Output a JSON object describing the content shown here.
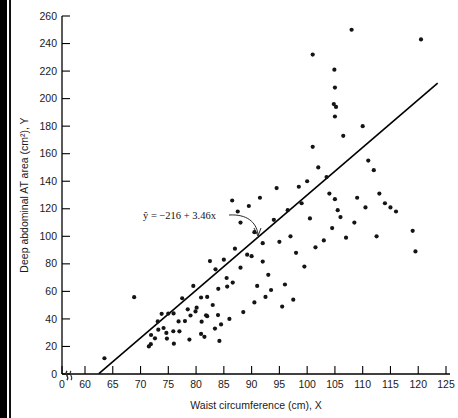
{
  "figure": {
    "background": "#ffffff",
    "point_color": "#141414",
    "line_color": "#000000",
    "axis_color": "#000000"
  },
  "annotation": {
    "equation": "ŷ = −216 + 3.46x",
    "equation_plain": "y-hat = -216 + 3.46x",
    "intercept": -216,
    "slope": 3.46
  },
  "axes": {
    "x_title": "Waist circumference (cm), X",
    "y_title": "Deep abdominal AT area (cm²), Y",
    "x_ticks": [
      0,
      60,
      65,
      70,
      75,
      80,
      85,
      90,
      95,
      100,
      105,
      110,
      115,
      120,
      125
    ],
    "y_ticks": [
      0,
      20,
      40,
      60,
      80,
      100,
      120,
      140,
      160,
      180,
      200,
      220,
      240,
      260
    ],
    "x_break_after_zero": true,
    "y_break_near_zero": true,
    "grid": false
  },
  "caption_sliver": "",
  "chart_data": {
    "type": "scatter",
    "title": "",
    "xlabel": "Waist circumference (cm), X",
    "ylabel": "Deep abdominal AT area (cm²), Y",
    "xlim": [
      60,
      125
    ],
    "ylim": [
      0,
      260
    ],
    "grid": false,
    "legend": null,
    "fit": {
      "type": "linear",
      "label": "ŷ = −216 + 3.46x",
      "intercept": -216,
      "slope": 3.46,
      "x_start": 62.5,
      "x_end": 123.5
    },
    "series": [
      {
        "name": "subjects",
        "n": 109,
        "points": [
          [
            74.75,
            25.72
          ],
          [
            72.6,
            25.89
          ],
          [
            81.8,
            42.6
          ],
          [
            83.95,
            42.8
          ],
          [
            74.65,
            29.84
          ],
          [
            71.85,
            21.68
          ],
          [
            80.9,
            29.08
          ],
          [
            83.4,
            32.98
          ],
          [
            63.5,
            11.44
          ],
          [
            73.2,
            32.22
          ],
          [
            71.9,
            28.32
          ],
          [
            75.0,
            43.86
          ],
          [
            73.1,
            38.21
          ],
          [
            79.0,
            42.48
          ],
          [
            77.0,
            30.96
          ],
          [
            68.85,
            55.78
          ],
          [
            75.95,
            43.99
          ],
          [
            74.15,
            33.41
          ],
          [
            73.8,
            43.71
          ],
          [
            75.9,
            31.06
          ],
          [
            76.85,
            38.21
          ],
          [
            80.9,
            55.56
          ],
          [
            79.9,
            45.41
          ],
          [
            89.2,
            86.67
          ],
          [
            82.0,
            56.0
          ],
          [
            92.0,
            81.63
          ],
          [
            86.6,
            66.38
          ],
          [
            80.1,
            48.16
          ],
          [
            90.0,
            85.55
          ],
          [
            85.5,
            69.71
          ],
          [
            88.0,
            77.19
          ],
          [
            78.0,
            38.44
          ],
          [
            85.6,
            63.49
          ],
          [
            84.0,
            61.83
          ],
          [
            87.0,
            91.0
          ],
          [
            83.0,
            50.1
          ],
          [
            82.0,
            42.0
          ],
          [
            81.0,
            38.0
          ],
          [
            88.5,
            45.0
          ],
          [
            90.5,
            52.0
          ],
          [
            86.0,
            40.0
          ],
          [
            84.5,
            36.0
          ],
          [
            92.5,
            56.0
          ],
          [
            91.0,
            64.0
          ],
          [
            93.0,
            72.0
          ],
          [
            95.0,
            96.0
          ],
          [
            94.0,
            112.0
          ],
          [
            96.5,
            119.0
          ],
          [
            99.0,
            124.0
          ],
          [
            97.0,
            100.0
          ],
          [
            98.5,
            136.0
          ],
          [
            100.0,
            140.0
          ],
          [
            91.5,
            128.0
          ],
          [
            89.5,
            122.0
          ],
          [
            94.5,
            135.0
          ],
          [
            96.0,
            65.0
          ],
          [
            98.0,
            88.0
          ],
          [
            99.5,
            78.0
          ],
          [
            101.0,
            165.0
          ],
          [
            102.0,
            150.0
          ],
          [
            103.5,
            143.0
          ],
          [
            104.0,
            131.0
          ],
          [
            105.0,
            127.0
          ],
          [
            105.5,
            119.0
          ],
          [
            106.0,
            114.0
          ],
          [
            104.5,
            106.0
          ],
          [
            103.0,
            97.0
          ],
          [
            101.5,
            92.0
          ],
          [
            100.5,
            113.0
          ],
          [
            106.5,
            173.0
          ],
          [
            105.0,
            187.0
          ],
          [
            104.8,
            196.0
          ],
          [
            105.2,
            194.0
          ],
          [
            105.0,
            208.0
          ],
          [
            104.9,
            221.0
          ],
          [
            101.0,
            232.0
          ],
          [
            108.0,
            250.0
          ],
          [
            120.5,
            243.0
          ],
          [
            110.0,
            180.0
          ],
          [
            111.0,
            155.0
          ],
          [
            112.0,
            148.0
          ],
          [
            113.0,
            131.0
          ],
          [
            114.0,
            124.0
          ],
          [
            115.0,
            121.0
          ],
          [
            116.0,
            118.0
          ],
          [
            110.5,
            121.0
          ],
          [
            109.0,
            128.0
          ],
          [
            108.5,
            110.0
          ],
          [
            107.0,
            99.0
          ],
          [
            112.5,
            100.0
          ],
          [
            119.0,
            104.0
          ],
          [
            119.5,
            89.0
          ],
          [
            97.5,
            54.0
          ],
          [
            93.5,
            61.0
          ],
          [
            95.5,
            49.0
          ],
          [
            88.0,
            110.0
          ],
          [
            87.5,
            118.0
          ],
          [
            86.5,
            126.0
          ],
          [
            90.5,
            103.0
          ],
          [
            92.0,
            95.0
          ],
          [
            85.0,
            83.0
          ],
          [
            83.5,
            76.0
          ],
          [
            82.5,
            82.0
          ],
          [
            79.5,
            64.0
          ],
          [
            78.5,
            47.0
          ],
          [
            77.5,
            55.0
          ],
          [
            76.0,
            22.0
          ],
          [
            78.8,
            25.0
          ],
          [
            81.5,
            27.0
          ],
          [
            84.2,
            24.0
          ],
          [
            71.5,
            20.0
          ]
        ]
      }
    ]
  }
}
